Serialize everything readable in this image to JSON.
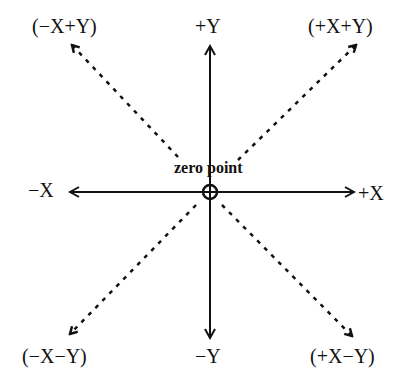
{
  "diagram": {
    "center_label": "zero point",
    "axes": {
      "pos_y": "+Y",
      "neg_y": "−Y",
      "pos_x": "+X",
      "neg_x": "−X"
    },
    "diagonals": {
      "neg_x_pos_y": "(−X+Y)",
      "pos_x_pos_y": "(+X+Y)",
      "neg_x_neg_y": "(−X−Y)",
      "pos_x_neg_y": "(+X−Y)"
    },
    "colors": {
      "line": "#111111",
      "background": "#ffffff"
    }
  }
}
